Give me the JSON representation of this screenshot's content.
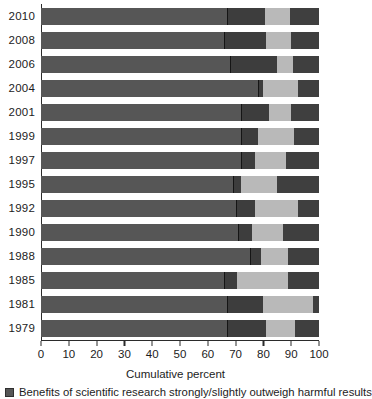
{
  "chart_data": {
    "type": "bar",
    "orientation": "horizontal",
    "stacked": true,
    "cumulative": true,
    "title": "",
    "xlabel": "Cumulative percent",
    "ylabel": "",
    "xlim": [
      0,
      100
    ],
    "xticks": [
      0,
      10,
      20,
      30,
      40,
      50,
      60,
      70,
      80,
      90,
      100
    ],
    "xtick_labels": [
      "0",
      "10",
      "20",
      "30",
      "40",
      "50",
      "60",
      "70",
      "80",
      "90",
      "100"
    ],
    "grid": false,
    "legend_position": "below",
    "categories": [
      "2010",
      "2008",
      "2006",
      "2004",
      "2001",
      "1999",
      "1997",
      "1995",
      "1992",
      "1990",
      "1988",
      "1985",
      "1981",
      "1979"
    ],
    "series": [
      {
        "name": "Benefits of scientific research strongly/slightly outweigh harmful results",
        "color": "#565656",
        "values": [
          67,
          66,
          68,
          78,
          72,
          72,
          72,
          69,
          70,
          71,
          75,
          66,
          67,
          67
        ]
      },
      {
        "name": "Segment 2",
        "color": "#3d3d3d",
        "values": [
          13.5,
          15,
          17,
          2,
          10,
          6,
          5,
          3,
          7,
          5,
          4,
          4.5,
          13,
          14
        ]
      },
      {
        "name": "Segment 3",
        "color": "#b9b9b9",
        "values": [
          9,
          9,
          5.5,
          12.5,
          8,
          13,
          11,
          13,
          15.5,
          11,
          10,
          18.5,
          18,
          10.5
        ]
      },
      {
        "name": "Segment 4",
        "color": "#3f3f3f",
        "values": [
          10.5,
          10,
          9.5,
          7.5,
          10,
          9,
          12,
          15,
          7.5,
          13,
          11,
          11,
          2,
          8.5
        ]
      }
    ],
    "cumulative_boundaries": [
      {
        "year": "2010",
        "b1": 67,
        "b2": 80.5,
        "b3": 89.5,
        "b4": 100
      },
      {
        "year": "2008",
        "b1": 66,
        "b2": 81,
        "b3": 90,
        "b4": 100
      },
      {
        "year": "2006",
        "b1": 68,
        "b2": 85,
        "b3": 90.5,
        "b4": 100
      },
      {
        "year": "2004",
        "b1": 78,
        "b2": 80,
        "b3": 92.5,
        "b4": 100
      },
      {
        "year": "2001",
        "b1": 72,
        "b2": 82,
        "b3": 90,
        "b4": 100
      },
      {
        "year": "1999",
        "b1": 72,
        "b2": 78,
        "b3": 91,
        "b4": 100
      },
      {
        "year": "1997",
        "b1": 72,
        "b2": 77,
        "b3": 88,
        "b4": 100
      },
      {
        "year": "1995",
        "b1": 69,
        "b2": 72,
        "b3": 85,
        "b4": 100
      },
      {
        "year": "1992",
        "b1": 70,
        "b2": 77,
        "b3": 92.5,
        "b4": 100
      },
      {
        "year": "1990",
        "b1": 71,
        "b2": 76,
        "b3": 87,
        "b4": 100
      },
      {
        "year": "1988",
        "b1": 75,
        "b2": 79,
        "b3": 89,
        "b4": 100
      },
      {
        "year": "1985",
        "b1": 66,
        "b2": 70.5,
        "b3": 89,
        "b4": 100
      },
      {
        "year": "1981",
        "b1": 67,
        "b2": 80,
        "b3": 98,
        "b4": 100
      },
      {
        "year": "1979",
        "b1": 67,
        "b2": 81,
        "b3": 91.5,
        "b4": 100
      }
    ]
  },
  "axis": {
    "x_title": "Cumulative percent"
  },
  "legend": {
    "items": [
      {
        "label": "Benefits of scientific research strongly/slightly outweigh harmful results",
        "color": "#565656"
      }
    ]
  }
}
